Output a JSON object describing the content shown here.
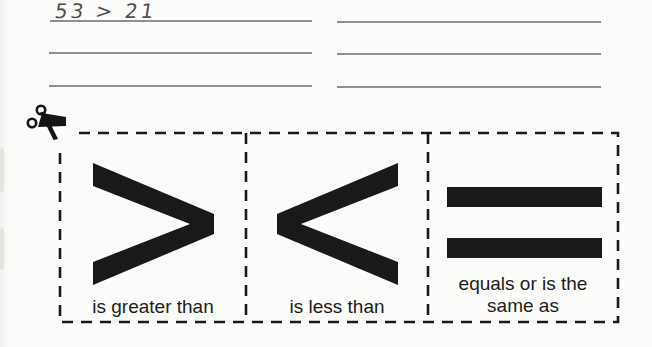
{
  "worksheet": {
    "handwritten_answer": "53 > 21",
    "answer_lines_left": 3,
    "answer_lines_right": 3
  },
  "cards": [
    {
      "name": "greater-than",
      "symbol": ">",
      "label": "is greater than"
    },
    {
      "name": "less-than",
      "symbol": "<",
      "label": "is less than"
    },
    {
      "name": "equals",
      "symbol": "=",
      "label": "equals or is the\nsame as"
    }
  ],
  "icons": {
    "scissors": "scissors-icon"
  },
  "colors": {
    "ink": "#1a1a1a",
    "symbol": "#191919",
    "answer_line": "#909090",
    "handwriting": "#4f4f4f",
    "paper": "#fcfcfb"
  }
}
